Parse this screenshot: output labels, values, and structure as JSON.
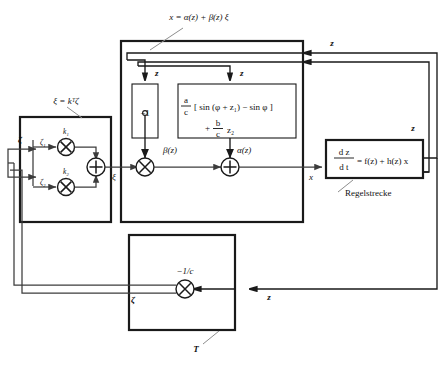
{
  "figure": {
    "type": "control-block-diagram",
    "title_label": "x = α(z) + β(z) ξ",
    "background": "#ffffff",
    "line_color": "#1a1a1a",
    "wire_color": "#3c3c3c",
    "leader_color": "#8d8d8d"
  },
  "labels": {
    "linearization_law": "x = α(z) + β(z) ξ",
    "gain_law": "ξ = kᵀζ",
    "plant_name": "Regelstrecke",
    "transform_name": "T"
  },
  "gain_block": {
    "name": "state-feedback-gain-block",
    "law": "ξ = kᵀζ",
    "input_vector": "ζ",
    "channels": [
      {
        "input_label": "ζ₁",
        "gain_label": "k₁",
        "operator": "×"
      },
      {
        "input_label": "ζ₂",
        "gain_label": "k₂",
        "operator": "×"
      }
    ],
    "summer_operator": "+",
    "output_label": "ξ"
  },
  "linearization_block": {
    "name": "feedback-linearization-block",
    "beta_block": {
      "value": "−1",
      "output_label": "β(z)",
      "input_label": "z"
    },
    "alpha_block": {
      "input_label": "z",
      "output_label": "α(z)",
      "expression_line1_num": "a",
      "expression_line1_den": "c",
      "expression_line1_rest": "[ sin (φ + z₁) − sin φ ]",
      "expression_line2_plus": "+",
      "expression_line2_num": "b",
      "expression_line2_den": "c",
      "expression_line2_rest": "z₂",
      "expression_full": "(a/c)[sin(φ+z₁) − sin φ] + (b/c) z₂"
    },
    "multiplier_operator": "×",
    "summer_operator": "+",
    "input_label": "ξ",
    "output_label": "x"
  },
  "plant_block": {
    "name": "plant-block",
    "equation_lhs_num": "d z",
    "equation_lhs_den": "d t",
    "equation_rhs": "= f(z) + h(z) x",
    "equation_full": "dz/dt = f(z) + h(z) x",
    "caption": "Regelstrecke",
    "output_label": "x"
  },
  "transform_block": {
    "name": "coordinate-transform-block",
    "caption": "T",
    "gain_label": "−1/c",
    "operator": "×",
    "input_label": "z",
    "output_label": "ζ"
  },
  "feedback_signals": {
    "z_to_linearization_upper": "z",
    "z_to_linearization_lower": "z",
    "z_right_bus": "z",
    "z_to_transform": "z",
    "zeta_to_gain": "ζ",
    "zeta_from_transform": "ζ"
  }
}
